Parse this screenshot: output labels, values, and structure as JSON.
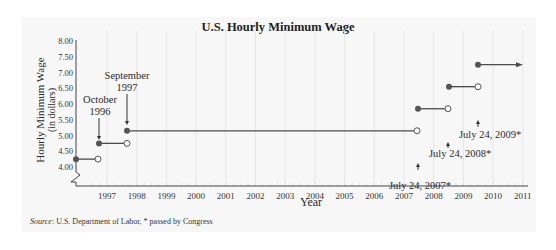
{
  "chart_data": {
    "type": "step-line",
    "title": "U.S. Hourly Minimum Wage",
    "xlabel": "Year",
    "ylabel": "Hourly Minimum Wage",
    "ylabel_sub": "(in dollars)",
    "ylim": [
      4.0,
      8.0
    ],
    "xlim": [
      1996,
      2011
    ],
    "y_ticks": [
      "4.00",
      "4.50",
      "5.00",
      "5.50",
      "6.00",
      "6.50",
      "7.00",
      "7.50",
      "8.00"
    ],
    "x_ticks": [
      "1997",
      "1998",
      "1999",
      "2000",
      "2001",
      "2002",
      "2003",
      "2004",
      "2005",
      "2006",
      "2007",
      "2008",
      "2009",
      "2010",
      "2011"
    ],
    "grid": {
      "vertical": true,
      "horizontal": false
    },
    "axis_break": true,
    "segments": [
      {
        "value": 4.25,
        "start": 1996.0,
        "end": 1996.75,
        "open_end": true
      },
      {
        "value": 4.75,
        "start": 1996.75,
        "end": 1997.67,
        "open_end": true
      },
      {
        "value": 5.15,
        "start": 1997.67,
        "end": 2007.56,
        "open_end": true
      },
      {
        "value": 5.85,
        "start": 2007.56,
        "end": 2008.56,
        "open_end": true
      },
      {
        "value": 6.55,
        "start": 2008.56,
        "end": 2009.56,
        "open_end": true
      },
      {
        "value": 7.25,
        "start": 2009.56,
        "end": 2011,
        "continues": true
      }
    ],
    "annotations": [
      {
        "text_lines": [
          "October",
          "1996"
        ],
        "points_to": 4.75
      },
      {
        "text_lines": [
          "September",
          "1997"
        ],
        "points_to": 5.15
      },
      {
        "text": "July 24, 2007*",
        "points_to": 5.15
      },
      {
        "text": "July 24, 2008*",
        "points_to": 5.85
      },
      {
        "text": "July 24, 2009*",
        "points_to": 6.55
      }
    ],
    "source_label": "Source",
    "source_text": ": U.S. Department of Labor,  * passed by Congress",
    "colors": {
      "line": "#4a4a4a",
      "point": "#555555",
      "grid": "#e6e6ea",
      "panel": "#f7f7f8"
    }
  }
}
